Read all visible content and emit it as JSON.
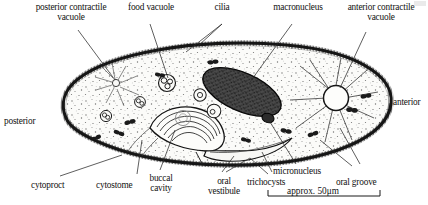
{
  "figure": {
    "organism": "Paramecium",
    "style": "scanned line drawing, stippled cytoplasm, serif labels with leader lines",
    "background_color": "#ffffff",
    "ink_color": "#111111",
    "membrane_color": "#1a1a1a",
    "cytoplasm_color": "#fafaf8",
    "macronucleus_color": "#3a3a3a"
  },
  "labels": {
    "posterior_contractile_vacuole": {
      "line1": "posterior contractile",
      "line2": "vacuole"
    },
    "food_vacuole": {
      "line1": "food vacuole"
    },
    "cilia": {
      "line1": "cilia"
    },
    "macronucleus": {
      "line1": "macronucleus"
    },
    "anterior_contractile_vacuole": {
      "line1": "anterior contractile",
      "line2": "vacuole"
    },
    "anterior": {
      "line1": "anterior"
    },
    "posterior": {
      "line1": "posterior"
    },
    "cytoproct": {
      "line1": "cytoproct"
    },
    "cytostome": {
      "line1": "cytostome"
    },
    "buccal_cavity": {
      "line1": "buccal",
      "line2": "cavity"
    },
    "oral_vestibule": {
      "line1": "oral",
      "line2": "vestibule"
    },
    "trichocysts": {
      "line1": "trichocysts"
    },
    "micronucleus": {
      "line1": "micronucleus"
    },
    "oral_groove": {
      "line1": "oral groove"
    }
  },
  "scale_bar": {
    "text": "approx.",
    "value": "50",
    "unit": "μm",
    "full_text": "approx. 50μm"
  }
}
